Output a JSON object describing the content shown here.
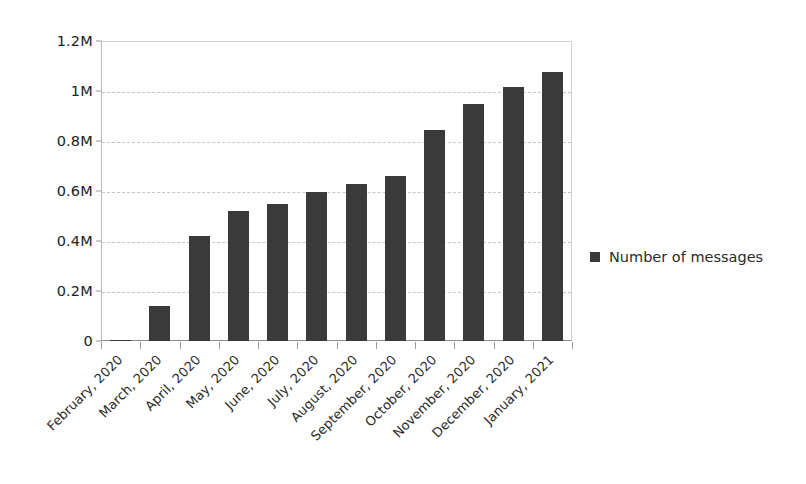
{
  "chart_data": {
    "type": "bar",
    "title": "",
    "subtitle": "",
    "xlabel": "",
    "ylabel": "",
    "grid": true,
    "legend_position": "right",
    "orientation": "vertical",
    "bar_color": "#3a3a3a",
    "ylim": [
      0,
      1200000
    ],
    "ytick_values": [
      0,
      200000,
      400000,
      600000,
      800000,
      1000000,
      1200000
    ],
    "ytick_labels": [
      "0",
      "0.2M",
      "0.4M",
      "0.6M",
      "0.8M",
      "1M",
      "1.2M"
    ],
    "categories": [
      "February, 2020",
      "March, 2020",
      "April, 2020",
      "May, 2020",
      "June, 2020",
      "July, 2020",
      "August, 2020",
      "September, 2020",
      "October, 2020",
      "November, 2020",
      "December, 2020",
      "January, 2021"
    ],
    "series": [
      {
        "name": "Number of messages",
        "color": "#3a3a3a",
        "values": [
          5000,
          142000,
          420000,
          520000,
          550000,
          595000,
          630000,
          660000,
          845000,
          950000,
          1015000,
          1075000
        ]
      }
    ]
  },
  "legend": {
    "entries": [
      {
        "label": "Number of messages",
        "color": "#3a3a3a",
        "marker": "square-marker"
      }
    ]
  }
}
